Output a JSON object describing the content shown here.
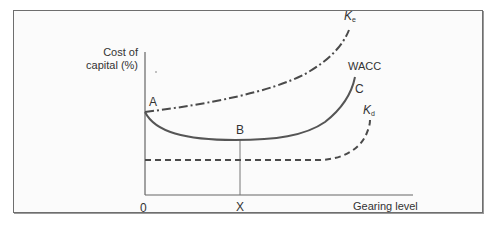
{
  "diagram": {
    "y_axis_label_line1": "Cost of",
    "y_axis_label_line2": "capital (%)",
    "x_axis_label": "Gearing level",
    "origin_label": "0",
    "x_marker_label": "X",
    "points": {
      "a": "A",
      "b": "B",
      "c": "C"
    },
    "curves": {
      "ke": {
        "symbol": "K",
        "subscript": "e",
        "style": "dash-dot"
      },
      "wacc": {
        "label": "WACC",
        "style": "solid"
      },
      "kd": {
        "symbol": "K",
        "subscript": "d",
        "style": "dashed"
      }
    },
    "colors": {
      "ke": "#4a4a4a",
      "wacc": "#555555",
      "kd": "#4a4a4a",
      "axes": "#666666",
      "frame": "#6e6e6e",
      "text": "#333333"
    }
  }
}
